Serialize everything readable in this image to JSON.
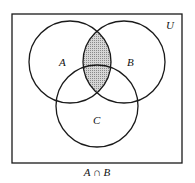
{
  "diagram": {
    "type": "venn",
    "universe_label": "U",
    "sets": [
      {
        "label": "A",
        "cx": 70,
        "cy": 62,
        "r": 41
      },
      {
        "label": "B",
        "cx": 124,
        "cy": 62,
        "r": 41
      },
      {
        "label": "C",
        "cx": 97,
        "cy": 106,
        "r": 41
      }
    ],
    "shaded_region": "A ∩ B",
    "caption": "A ∩ B",
    "colors": {
      "stroke": "#1a1a1a",
      "shade": "#b8b8b8",
      "background": "#ffffff"
    }
  }
}
